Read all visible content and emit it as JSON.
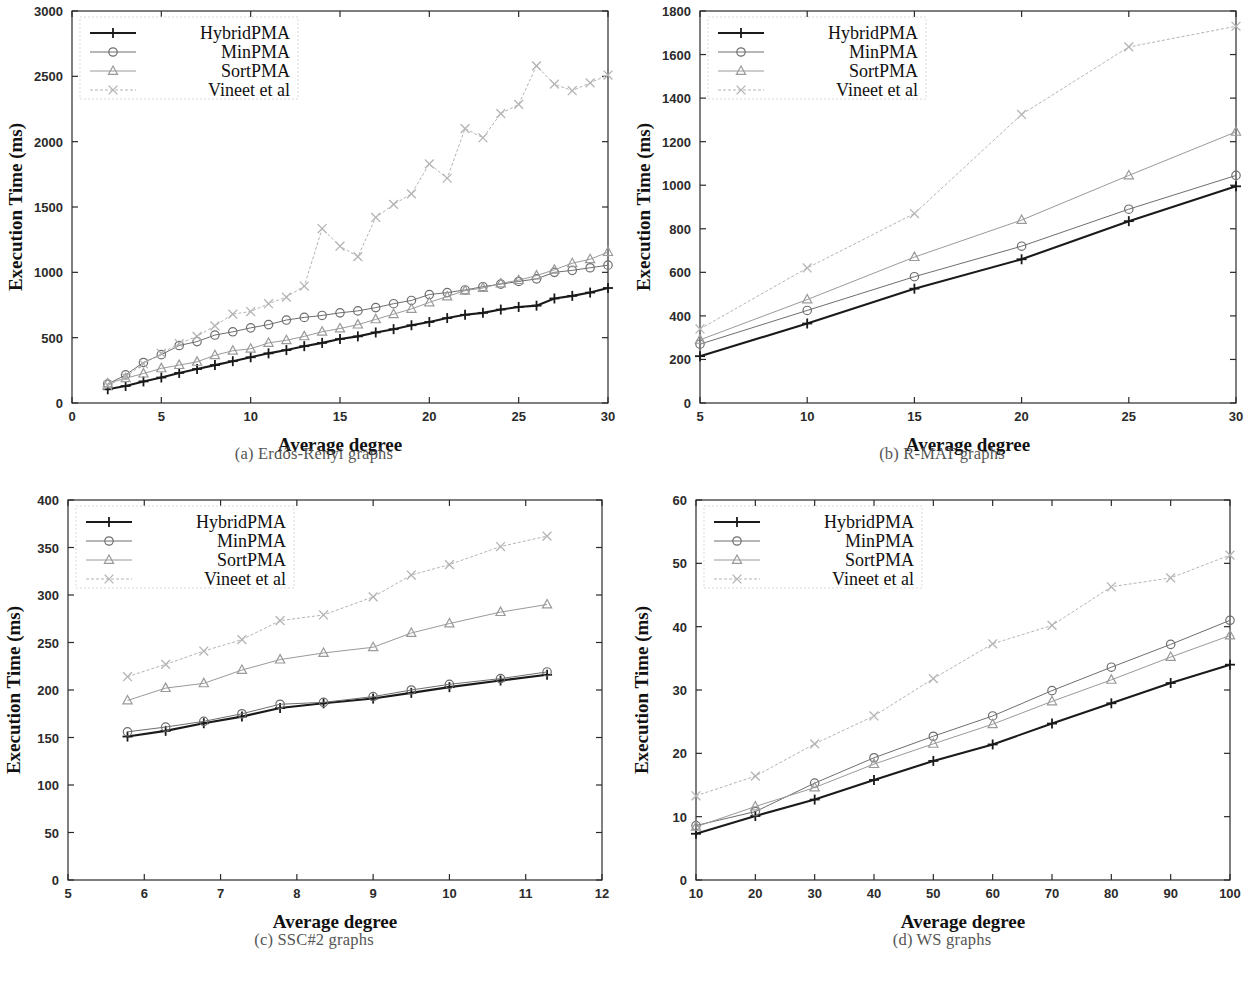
{
  "figure": {
    "axis_x_title": "Average degree",
    "axis_y_title": "Execution Time (ms)",
    "series_names": [
      "HybridPMA",
      "MinPMA",
      "SortPMA",
      "Vineet et al"
    ],
    "series_markers": [
      "plus-marker",
      "circle-marker",
      "triangle-marker",
      "cross-marker"
    ],
    "series_colors": [
      "#1a1a1a",
      "#6e6e6e",
      "#9a9a9a",
      "#b4b4b4"
    ],
    "captions": {
      "a": "(a)  Erdős-Rényi graphs",
      "b": "(b)  R-MAT graphs",
      "c": "(c)  SSC#2 graphs",
      "d": "(d)  WS graphs"
    }
  },
  "chart_data": [
    {
      "id": "panel-a",
      "type": "line",
      "title": "(a)  Erdős-Rényi graphs",
      "xlabel": "Average degree",
      "ylabel": "Execution Time (ms)",
      "xlim": [
        0,
        30
      ],
      "ylim": [
        0,
        3000
      ],
      "xticks": [
        0,
        5,
        10,
        15,
        20,
        25,
        30
      ],
      "yticks": [
        0,
        500,
        1000,
        1500,
        2000,
        2500,
        3000
      ],
      "grid": false,
      "legend_position": "top-left",
      "x": [
        2,
        3,
        4,
        5,
        6,
        7,
        8,
        9,
        10,
        11,
        12,
        13,
        14,
        15,
        16,
        17,
        18,
        19,
        20,
        21,
        22,
        23,
        24,
        25,
        26,
        27,
        28,
        29,
        30
      ],
      "series": [
        {
          "name": "HybridPMA",
          "marker": "plus-marker",
          "values": [
            105,
            130,
            165,
            195,
            230,
            260,
            290,
            320,
            350,
            380,
            405,
            435,
            460,
            490,
            510,
            540,
            565,
            595,
            620,
            650,
            675,
            690,
            715,
            735,
            745,
            800,
            820,
            845,
            880
          ]
        },
        {
          "name": "MinPMA",
          "marker": "circle-marker",
          "values": [
            145,
            215,
            310,
            370,
            440,
            470,
            520,
            545,
            575,
            600,
            635,
            655,
            670,
            690,
            705,
            730,
            760,
            785,
            830,
            845,
            865,
            890,
            910,
            930,
            950,
            1000,
            1015,
            1035,
            1055
          ]
        },
        {
          "name": "SortPMA",
          "marker": "triangle-marker",
          "values": [
            150,
            190,
            225,
            265,
            290,
            315,
            365,
            400,
            415,
            460,
            480,
            510,
            545,
            570,
            600,
            640,
            680,
            720,
            770,
            815,
            860,
            880,
            915,
            940,
            975,
            1020,
            1070,
            1100,
            1155
          ]
        },
        {
          "name": "Vineet et al",
          "marker": "cross-marker",
          "values": [
            135,
            200,
            300,
            380,
            455,
            510,
            590,
            680,
            700,
            760,
            810,
            895,
            1335,
            1200,
            1120,
            1420,
            1520,
            1600,
            1830,
            1720,
            2100,
            2030,
            2215,
            2285,
            2580,
            2440,
            2390,
            2450,
            2510
          ]
        }
      ]
    },
    {
      "id": "panel-b",
      "type": "line",
      "title": "(b)  R-MAT graphs",
      "xlabel": "Average degree",
      "ylabel": "Execution Time (ms)",
      "xlim": [
        5,
        30
      ],
      "ylim": [
        0,
        1800
      ],
      "xticks": [
        5,
        10,
        15,
        20,
        25,
        30
      ],
      "yticks": [
        0,
        200,
        400,
        600,
        800,
        1000,
        1200,
        1400,
        1600,
        1800
      ],
      "grid": false,
      "legend_position": "top-left",
      "x": [
        5,
        10,
        15,
        20,
        25,
        30
      ],
      "series": [
        {
          "name": "HybridPMA",
          "marker": "plus-marker",
          "values": [
            215,
            365,
            525,
            660,
            835,
            995
          ]
        },
        {
          "name": "MinPMA",
          "marker": "circle-marker",
          "values": [
            270,
            425,
            580,
            720,
            890,
            1045
          ]
        },
        {
          "name": "SortPMA",
          "marker": "triangle-marker",
          "values": [
            290,
            475,
            670,
            840,
            1045,
            1245
          ]
        },
        {
          "name": "Vineet et al",
          "marker": "cross-marker",
          "values": [
            340,
            620,
            870,
            1325,
            1635,
            1730
          ]
        }
      ]
    },
    {
      "id": "panel-c",
      "type": "line",
      "title": "(c)  SSC#2 graphs",
      "xlabel": "Average degree",
      "ylabel": "Execution Time (ms)",
      "xlim": [
        5,
        12
      ],
      "ylim": [
        0,
        400
      ],
      "xticks": [
        5,
        6,
        7,
        8,
        9,
        10,
        11,
        12
      ],
      "yticks": [
        0,
        50,
        100,
        150,
        200,
        250,
        300,
        350,
        400
      ],
      "grid": false,
      "legend_position": "top-left",
      "x": [
        5.78,
        6.28,
        6.78,
        7.28,
        7.78,
        8.35,
        9.0,
        9.5,
        10.0,
        10.67,
        11.28
      ],
      "series": [
        {
          "name": "HybridPMA",
          "marker": "plus-marker",
          "values": [
            151,
            157,
            165,
            172,
            181,
            186,
            191,
            197,
            203,
            210,
            216
          ]
        },
        {
          "name": "MinPMA",
          "marker": "circle-marker",
          "values": [
            156,
            161,
            167,
            175,
            185,
            187,
            193,
            200,
            206,
            212,
            219
          ]
        },
        {
          "name": "SortPMA",
          "marker": "triangle-marker",
          "values": [
            189,
            202,
            207,
            221,
            232,
            239,
            245,
            260,
            270,
            282,
            290
          ]
        },
        {
          "name": "Vineet et al",
          "marker": "cross-marker",
          "values": [
            214,
            227,
            241,
            253,
            273,
            279,
            298,
            321,
            332,
            351,
            362
          ]
        }
      ]
    },
    {
      "id": "panel-d",
      "type": "line",
      "title": "(d)  WS graphs",
      "xlabel": "Average degree",
      "ylabel": "Execution Time (ms)",
      "xlim": [
        10,
        100
      ],
      "ylim": [
        0,
        60
      ],
      "xticks": [
        10,
        20,
        30,
        40,
        50,
        60,
        70,
        80,
        90,
        100
      ],
      "yticks": [
        0,
        10,
        20,
        30,
        40,
        50,
        60
      ],
      "grid": false,
      "legend_position": "top-left",
      "x": [
        10,
        20,
        30,
        40,
        50,
        60,
        70,
        80,
        90,
        100
      ],
      "series": [
        {
          "name": "HybridPMA",
          "marker": "plus-marker",
          "values": [
            7.3,
            10.1,
            12.7,
            15.8,
            18.8,
            21.4,
            24.7,
            27.9,
            31.1,
            34.0
          ]
        },
        {
          "name": "MinPMA",
          "marker": "circle-marker",
          "values": [
            8.6,
            10.8,
            15.3,
            19.3,
            22.7,
            25.9,
            29.9,
            33.6,
            37.2,
            41.0
          ]
        },
        {
          "name": "SortPMA",
          "marker": "triangle-marker",
          "values": [
            8.4,
            11.6,
            14.6,
            18.3,
            21.5,
            24.6,
            28.2,
            31.6,
            35.2,
            38.6
          ]
        },
        {
          "name": "Vineet et al",
          "marker": "cross-marker",
          "values": [
            13.3,
            16.4,
            21.5,
            25.9,
            31.8,
            37.3,
            40.2,
            46.3,
            47.7,
            51.3
          ]
        }
      ]
    }
  ]
}
